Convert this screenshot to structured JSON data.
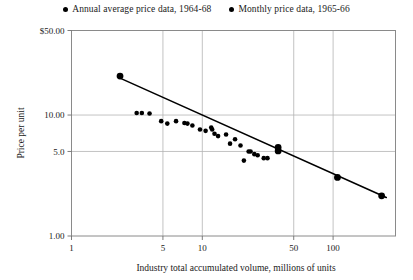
{
  "legend": {
    "entries": [
      {
        "marker": "filled-circle-icon",
        "label": "Annual average price data, 1964-68"
      },
      {
        "marker": "filled-circle-icon",
        "label": "Monthly price data, 1965-66"
      }
    ]
  },
  "axes": {
    "ylabel": "Price per unit",
    "xlabel": "Industry total accumulated volume, millions of units",
    "yticks": [
      "$50.00",
      "10.00",
      "5.0",
      "1.00"
    ],
    "ytick_values": [
      50,
      10,
      5,
      1
    ],
    "xticks": [
      "1",
      "5",
      "10",
      "50",
      "100"
    ],
    "xtick_values": [
      1,
      5,
      10,
      50,
      100
    ]
  },
  "chart_data": {
    "type": "scatter",
    "title": "",
    "xlabel": "Industry total accumulated volume, millions of units",
    "ylabel": "Price per unit",
    "xscale": "log",
    "yscale": "log",
    "xlim": [
      1,
      300
    ],
    "ylim": [
      1,
      50
    ],
    "grid": true,
    "legend_position": "top-center",
    "xticks": [
      1,
      5,
      10,
      50,
      100
    ],
    "xtick_labels": [
      "1",
      "5",
      "10",
      "50",
      "100"
    ],
    "yticks": [
      1,
      5,
      10,
      50
    ],
    "ytick_labels": [
      "1.00",
      "5.0",
      "10.00",
      "$50.00"
    ],
    "series": [
      {
        "name": "Annual average price data, 1964-68",
        "marker": "large-filled-circle",
        "marker_radius_px": 3.4,
        "points": [
          {
            "x": 2.35,
            "y": 21.0
          },
          {
            "x": 38.0,
            "y": 5.4
          },
          {
            "x": 38.0,
            "y": 5.05
          },
          {
            "x": 108.0,
            "y": 3.05
          },
          {
            "x": 235.0,
            "y": 2.15
          }
        ]
      },
      {
        "name": "Monthly price data, 1965-66",
        "marker": "small-filled-circle",
        "marker_radius_px": 2.3,
        "points": [
          {
            "x": 3.15,
            "y": 10.4
          },
          {
            "x": 3.45,
            "y": 10.4
          },
          {
            "x": 3.95,
            "y": 10.3
          },
          {
            "x": 4.85,
            "y": 8.9
          },
          {
            "x": 5.4,
            "y": 8.5
          },
          {
            "x": 6.3,
            "y": 8.9
          },
          {
            "x": 7.3,
            "y": 8.6
          },
          {
            "x": 7.7,
            "y": 8.5
          },
          {
            "x": 8.4,
            "y": 8.2
          },
          {
            "x": 9.6,
            "y": 7.6
          },
          {
            "x": 10.6,
            "y": 7.4
          },
          {
            "x": 11.7,
            "y": 7.9
          },
          {
            "x": 11.9,
            "y": 7.6
          },
          {
            "x": 12.4,
            "y": 7.0
          },
          {
            "x": 13.2,
            "y": 6.7
          },
          {
            "x": 15.2,
            "y": 6.9
          },
          {
            "x": 16.3,
            "y": 5.8
          },
          {
            "x": 17.8,
            "y": 6.3
          },
          {
            "x": 19.6,
            "y": 5.6
          },
          {
            "x": 20.8,
            "y": 4.2
          },
          {
            "x": 22.6,
            "y": 5.0
          },
          {
            "x": 23.4,
            "y": 5.0
          },
          {
            "x": 25.0,
            "y": 4.75
          },
          {
            "x": 26.5,
            "y": 4.65
          },
          {
            "x": 29.5,
            "y": 4.4
          },
          {
            "x": 31.5,
            "y": 4.4
          }
        ]
      }
    ],
    "trendline": {
      "name": "experience-curve-fit",
      "x_start": 2.35,
      "y_start": 20.2,
      "x_end": 255.0,
      "y_end": 2.08
    }
  }
}
